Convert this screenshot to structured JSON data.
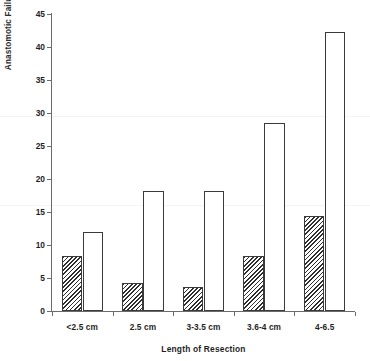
{
  "chart_data": {
    "type": "bar",
    "title": "",
    "xlabel": "Length of Resection",
    "ylabel": "Anastomotic Failure Rate",
    "categories": [
      "<2.5 cm",
      "2.5 cm",
      "3-3.5 cm",
      "3.6-4 cm",
      "4-6.5"
    ],
    "series": [
      {
        "name": "hatched",
        "values": [
          8.3,
          4.2,
          3.7,
          8.3,
          14.4
        ]
      },
      {
        "name": "open",
        "values": [
          11.9,
          18.2,
          18.2,
          28.5,
          42.2
        ]
      }
    ],
    "ylim": [
      0,
      45
    ],
    "ytick_labels": [
      "0",
      "5",
      "10",
      "15",
      "20",
      "25",
      "30",
      "35",
      "40",
      "45"
    ],
    "ytick_values": [
      0,
      5,
      10,
      15,
      20,
      25,
      30,
      35,
      40,
      45
    ],
    "grid": false,
    "legend": "none"
  },
  "axes": {
    "y_title": "Anastomotic Failure Rate",
    "x_title": "Length of Resection"
  },
  "colors": {
    "axis": "#6b6b6b",
    "bar_outline": "#3a3a3a",
    "hatch": "#2e2e2e",
    "open_fill": "#ffffff",
    "text": "#1f1f1f",
    "background": "#ffffff"
  }
}
